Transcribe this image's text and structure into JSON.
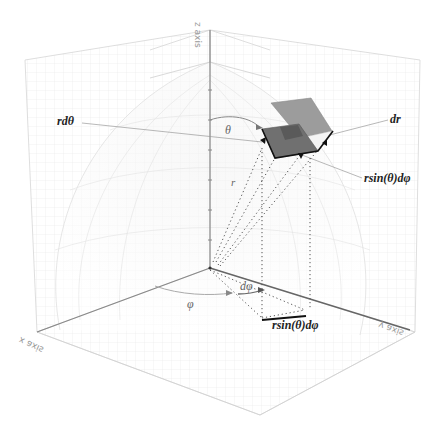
{
  "diagram": {
    "axes": {
      "x": "x axis",
      "y": "y axis",
      "z": "z axis"
    },
    "labels": {
      "r_dtheta": "rdθ",
      "dr": "dr",
      "r_sin_theta_dphi_upper": "rsin(θ)dφ",
      "r_sin_theta_dphi_lower": "rsin(θ)dφ",
      "theta": "θ",
      "r": "r",
      "phi": "φ",
      "dphi": "dφ"
    },
    "colors": {
      "background": "#ffffff",
      "grid": "#dcdcdc",
      "axis": "#777777",
      "surface_light": "#9a9a9a",
      "surface_dark": "#6e6e6e",
      "edge": "#111111"
    }
  }
}
